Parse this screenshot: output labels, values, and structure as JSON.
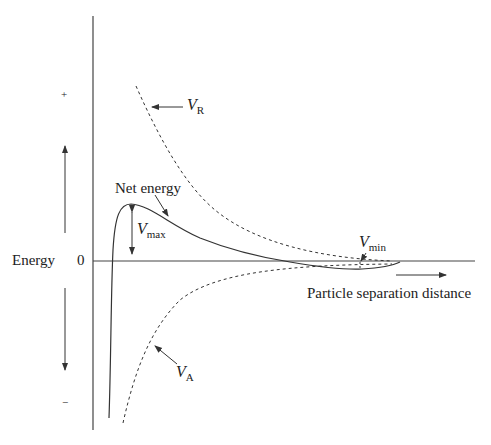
{
  "diagram": {
    "y_axis": {
      "label": "Energy",
      "zero_label": "0",
      "positive_label": "+",
      "negative_label": "−"
    },
    "x_axis": {
      "label": "Particle separation distance"
    },
    "curves": [
      {
        "id": "VR",
        "name": "V",
        "subscript": "R",
        "style": "dashed",
        "description": "Repulsive energy"
      },
      {
        "id": "VA",
        "name": "V",
        "subscript": "A",
        "style": "dashed",
        "description": "Attractive energy"
      },
      {
        "id": "net",
        "name": "Net energy",
        "style": "solid"
      }
    ],
    "annotations": {
      "vmax": {
        "name": "V",
        "subscript": "max"
      },
      "vmin": {
        "name": "V",
        "subscript": "min"
      },
      "net_energy": "Net energy"
    },
    "colors": {
      "line": "#333333",
      "background": "#ffffff"
    }
  }
}
